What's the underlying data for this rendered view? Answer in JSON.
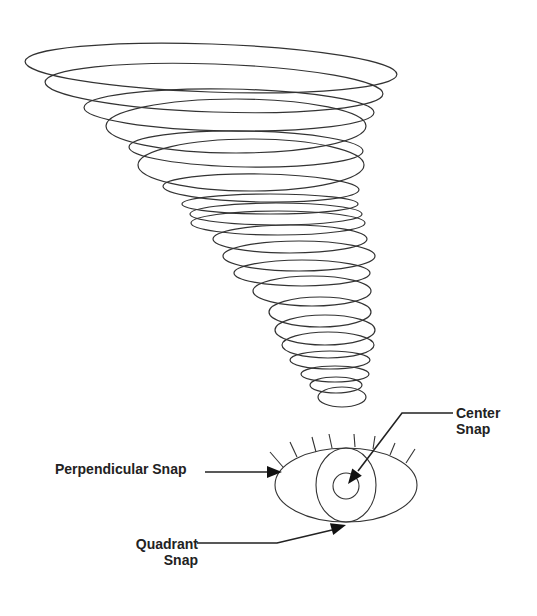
{
  "figure": {
    "type": "technical illustration"
  },
  "colors": {
    "stroke": "#333333",
    "text": "#222222",
    "background": "#ffffff"
  },
  "tornado": {
    "ellipses": [
      {
        "cx": 211,
        "cy": 68,
        "rx": 186,
        "ry": 24,
        "rot": 2
      },
      {
        "cx": 214,
        "cy": 88,
        "rx": 169,
        "ry": 24,
        "rot": 2
      },
      {
        "cx": 229,
        "cy": 110,
        "rx": 145,
        "ry": 21,
        "rot": 1
      },
      {
        "cx": 236,
        "cy": 126,
        "rx": 130,
        "ry": 27,
        "rot": 0
      },
      {
        "cx": 246,
        "cy": 149,
        "rx": 117,
        "ry": 18,
        "rot": 1
      },
      {
        "cx": 251,
        "cy": 165,
        "rx": 113,
        "ry": 26,
        "rot": 0
      },
      {
        "cx": 261,
        "cy": 188,
        "rx": 98,
        "ry": 14,
        "rot": 1
      },
      {
        "cx": 270,
        "cy": 204,
        "rx": 88,
        "ry": 10,
        "rot": 0
      },
      {
        "cx": 276,
        "cy": 214,
        "rx": 86,
        "ry": 11,
        "rot": 0
      },
      {
        "cx": 278,
        "cy": 223,
        "rx": 87,
        "ry": 12,
        "rot": 0
      },
      {
        "cx": 290,
        "cy": 239,
        "rx": 77,
        "ry": 14,
        "rot": 0
      },
      {
        "cx": 299,
        "cy": 256,
        "rx": 76,
        "ry": 15,
        "rot": 0
      },
      {
        "cx": 302,
        "cy": 273,
        "rx": 68,
        "ry": 13,
        "rot": 0
      },
      {
        "cx": 312,
        "cy": 291,
        "rx": 59,
        "ry": 15,
        "rot": 0
      },
      {
        "cx": 320,
        "cy": 312,
        "rx": 51,
        "ry": 15,
        "rot": 0
      },
      {
        "cx": 325,
        "cy": 330,
        "rx": 50,
        "ry": 15,
        "rot": 0
      },
      {
        "cx": 328,
        "cy": 345,
        "rx": 46,
        "ry": 13,
        "rot": 0
      },
      {
        "cx": 330,
        "cy": 360,
        "rx": 40,
        "ry": 9,
        "rot": 0
      },
      {
        "cx": 335,
        "cy": 374,
        "rx": 34,
        "ry": 8,
        "rot": 0
      },
      {
        "cx": 336,
        "cy": 385,
        "rx": 26,
        "ry": 8,
        "rot": 0
      },
      {
        "cx": 342,
        "cy": 397,
        "rx": 24,
        "ry": 10,
        "rot": 0
      }
    ]
  },
  "eye": {
    "outer": {
      "cx": 346,
      "cy": 485,
      "rx": 71,
      "ry": 37
    },
    "iris": {
      "cx": 346,
      "cy": 485,
      "rx": 30,
      "ry": 37
    },
    "pupil": {
      "cx": 346,
      "cy": 486,
      "r": 13
    },
    "lashes": [
      [
        270,
        452,
        283,
        467
      ],
      [
        290,
        442,
        297,
        457
      ],
      [
        312,
        437,
        316,
        452
      ],
      [
        329,
        434,
        332,
        448
      ],
      [
        354,
        434,
        355,
        447
      ],
      [
        375,
        436,
        373,
        449
      ],
      [
        395,
        443,
        390,
        455
      ],
      [
        415,
        449,
        406,
        463
      ]
    ]
  },
  "callouts": {
    "perpendicular": {
      "label": "Perpendicular Snap",
      "path": "M205,472 L268,472",
      "tip": [
        282,
        472
      ],
      "angle": 0
    },
    "center": {
      "line1": "Center",
      "line2": "Snap",
      "path": "M453,413 L402,413 L358,471",
      "tip": [
        348,
        484
      ],
      "angle": 127
    },
    "quadrant": {
      "line1": "Quadrant",
      "line2": "Snap",
      "path": "M197,543 L277,543 L332,530",
      "tip": [
        346,
        525
      ],
      "angle": -16
    }
  }
}
